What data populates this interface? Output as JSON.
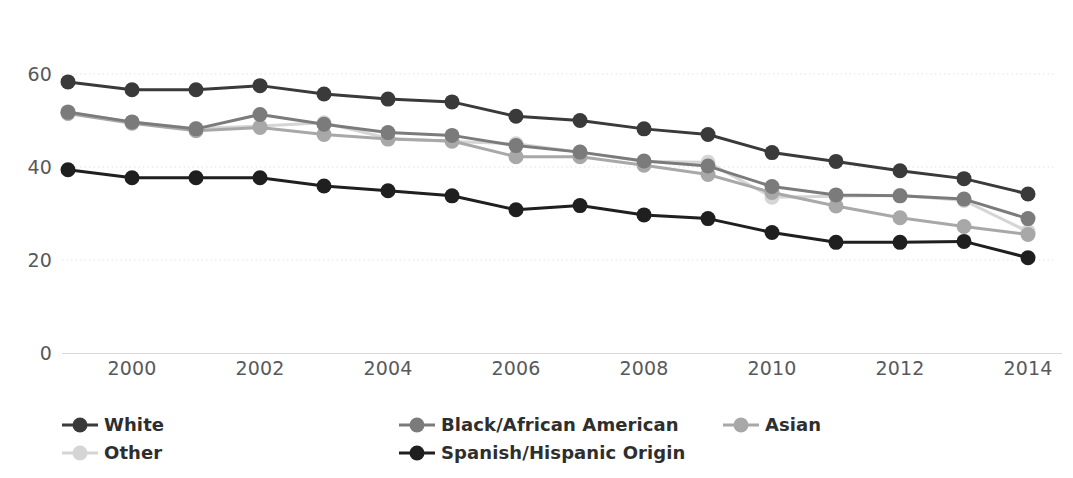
{
  "chart_data": {
    "type": "line",
    "title": "",
    "subtitle": "",
    "xlabel": "",
    "ylabel": "",
    "x": [
      1999,
      2000,
      2001,
      2002,
      2003,
      2004,
      2005,
      2006,
      2007,
      2008,
      2009,
      2010,
      2011,
      2012,
      2013,
      2014
    ],
    "xlim": [
      1999,
      2014
    ],
    "ylim": [
      0,
      80
    ],
    "xticks": [
      2000,
      2002,
      2004,
      2006,
      2008,
      2010,
      2012,
      2014
    ],
    "xtick_labels": [
      "2000",
      "2002",
      "2004",
      "2006",
      "2008",
      "2010",
      "2012",
      "2014"
    ],
    "yticks": [
      0,
      20,
      40,
      60,
      80
    ],
    "ytick_labels": [
      "0",
      "20",
      "40",
      "60",
      "80"
    ],
    "grid": "horizontal-dotted",
    "legend_position": "bottom",
    "series": [
      {
        "name": "White",
        "color": "#3a3a3a",
        "values": [
          58.3,
          56.6,
          56.6,
          57.5,
          55.7,
          54.6,
          54.0,
          50.9,
          50.0,
          48.2,
          47.0,
          43.1,
          41.2,
          39.2,
          37.5,
          34.2
        ]
      },
      {
        "name": "Black/African American",
        "color": "#7b7b7b",
        "values": [
          51.8,
          49.7,
          48.2,
          51.3,
          49.2,
          47.4,
          46.8,
          44.6,
          43.2,
          41.3,
          40.2,
          35.8,
          34.0,
          33.8,
          33.1,
          28.9
        ]
      },
      {
        "name": "Asian",
        "color": "#a8a8a8",
        "values": [
          51.5,
          49.4,
          47.8,
          48.5,
          47.0,
          46.0,
          45.6,
          42.2,
          42.2,
          40.4,
          38.4,
          34.5,
          31.6,
          29.1,
          27.2,
          25.5
        ]
      },
      {
        "name": "Other",
        "color": "#d5d5d5",
        "values": [
          51.9,
          49.6,
          48.3,
          48.8,
          49.5,
          46.2,
          45.5,
          45.0,
          43.2,
          41.2,
          41.0,
          33.5,
          33.7,
          33.9,
          32.8,
          26.1
        ]
      },
      {
        "name": "Spanish/Hispanic Origin",
        "color": "#1f1f1f",
        "values": [
          39.4,
          37.7,
          37.7,
          37.7,
          35.9,
          34.9,
          33.8,
          30.8,
          31.7,
          29.7,
          28.9,
          25.9,
          23.8,
          23.8,
          24.0,
          20.5
        ]
      }
    ]
  },
  "legend": {
    "entries": [
      {
        "label": "White",
        "color": "#3a3a3a"
      },
      {
        "label": "Black/African American",
        "color": "#7b7b7b"
      },
      {
        "label": "Asian",
        "color": "#a8a8a8"
      },
      {
        "label": "Other",
        "color": "#d5d5d5"
      },
      {
        "label": "Spanish/Hispanic Origin",
        "color": "#1f1f1f"
      }
    ]
  },
  "axis_colors": {
    "tick_text": "#58595b",
    "baseline": "#d9d9d9",
    "gridline": "#ededed"
  }
}
